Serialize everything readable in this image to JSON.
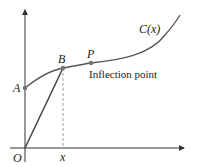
{
  "diagram": {
    "type": "cost-curve",
    "curve_label": "C(x)",
    "points": [
      {
        "id": "A",
        "label": "A"
      },
      {
        "id": "B",
        "label": "B"
      },
      {
        "id": "P",
        "label": "P"
      }
    ],
    "origin_label": "O",
    "x_label": "x",
    "annotation": "Inflection point",
    "colors": {
      "axis": "#333333",
      "curve": "#555555",
      "point": "#777777",
      "dashed": "#888888"
    }
  }
}
